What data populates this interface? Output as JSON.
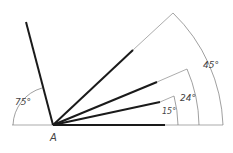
{
  "diagram": {
    "type": "angle-construction",
    "vertex_label": "A",
    "colors": {
      "thick": "#1a1a1a",
      "thin": "#888888",
      "arc": "#777777",
      "text": "#444444"
    },
    "angles": [
      {
        "id": "a75",
        "label": "75°",
        "degrees": 75,
        "side": "left"
      },
      {
        "id": "a45",
        "label": "45°",
        "degrees": 45
      },
      {
        "id": "a24",
        "label": "24°",
        "degrees": 24
      },
      {
        "id": "a15",
        "label": "15°",
        "degrees": 15
      }
    ]
  }
}
